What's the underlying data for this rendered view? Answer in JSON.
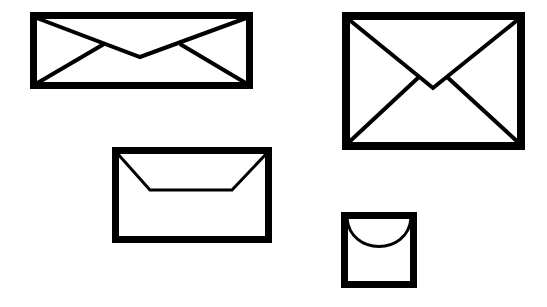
{
  "scene": {
    "title": "Four envelopes illustration",
    "background_color": "#ffffff",
    "stroke_color": "#000000",
    "width": 547,
    "height": 307
  },
  "envelopes": [
    {
      "id": "envelope-large-wide",
      "label": "Large wide envelope",
      "position": "top-left",
      "x": 30,
      "y": 12,
      "width": 223,
      "height": 77,
      "border_width": 7,
      "flap_style": "x-cross-shallow",
      "flap_stroke_width": 4,
      "flap_apex_x": 140,
      "flap_apex_y": 57,
      "fill": "#ffffff",
      "stroke": "#000000"
    },
    {
      "id": "envelope-large-tall",
      "label": "Large tall envelope",
      "position": "top-right",
      "x": 342,
      "y": 12,
      "width": 183,
      "height": 138,
      "border_width": 8,
      "flap_style": "x-cross-full",
      "flap_stroke_width": 4,
      "flap_apex_x": 433,
      "flap_apex_y": 88,
      "fill": "#ffffff",
      "stroke": "#000000"
    },
    {
      "id": "envelope-medium",
      "label": "Medium envelope",
      "position": "bottom-middle",
      "x": 112,
      "y": 147,
      "width": 160,
      "height": 96,
      "border_width": 7,
      "flap_style": "trapezoid",
      "flap_stroke_width": 3,
      "flap_base_y": 190,
      "flap_base_left_x": 150,
      "flap_base_right_x": 232,
      "fill": "#ffffff",
      "stroke": "#000000"
    },
    {
      "id": "envelope-small",
      "label": "Small square envelope",
      "position": "bottom-right",
      "x": 341,
      "y": 212,
      "width": 76,
      "height": 76,
      "border_width": 7,
      "flap_style": "curved-u",
      "flap_stroke_width": 3,
      "flap_depth": 38,
      "fill": "#ffffff",
      "stroke": "#000000"
    }
  ]
}
